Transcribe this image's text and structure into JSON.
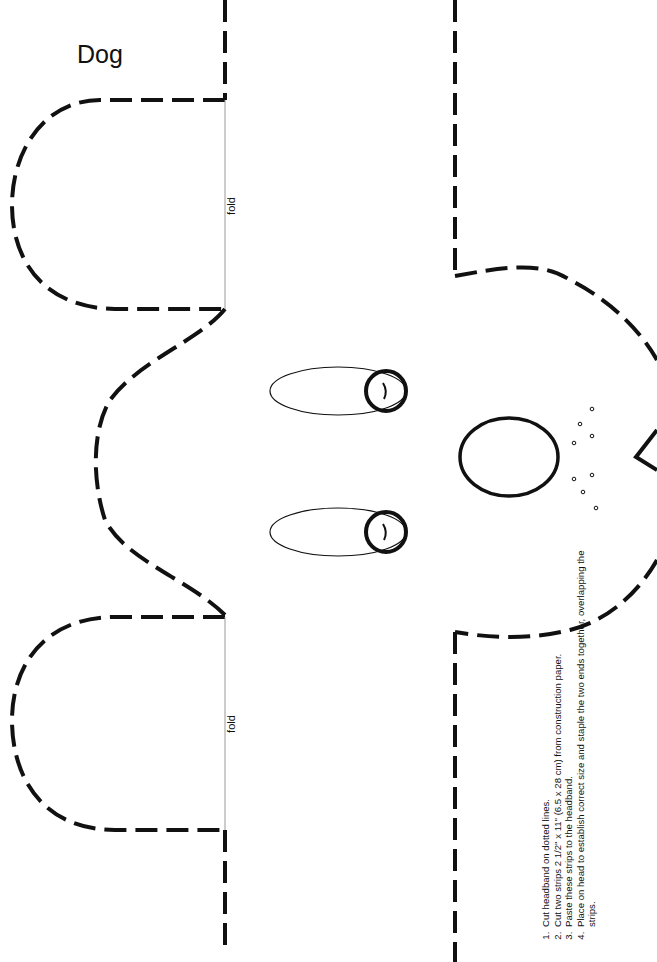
{
  "page": {
    "title": "Dog",
    "fold_labels": [
      "fold",
      "fold"
    ],
    "instructions": [
      "Cut headband on dotted lines.",
      "Cut two strips 2 1/2\" x 11\" (6.5 x 28 cm) from construction paper.",
      "Paste these strips to the headband.",
      "Place on head to establish correct size and staple the two ends together, overlapping the strips."
    ]
  },
  "colors": {
    "ink": "#111111",
    "paper": "#ffffff",
    "fold_line": "#999999"
  }
}
